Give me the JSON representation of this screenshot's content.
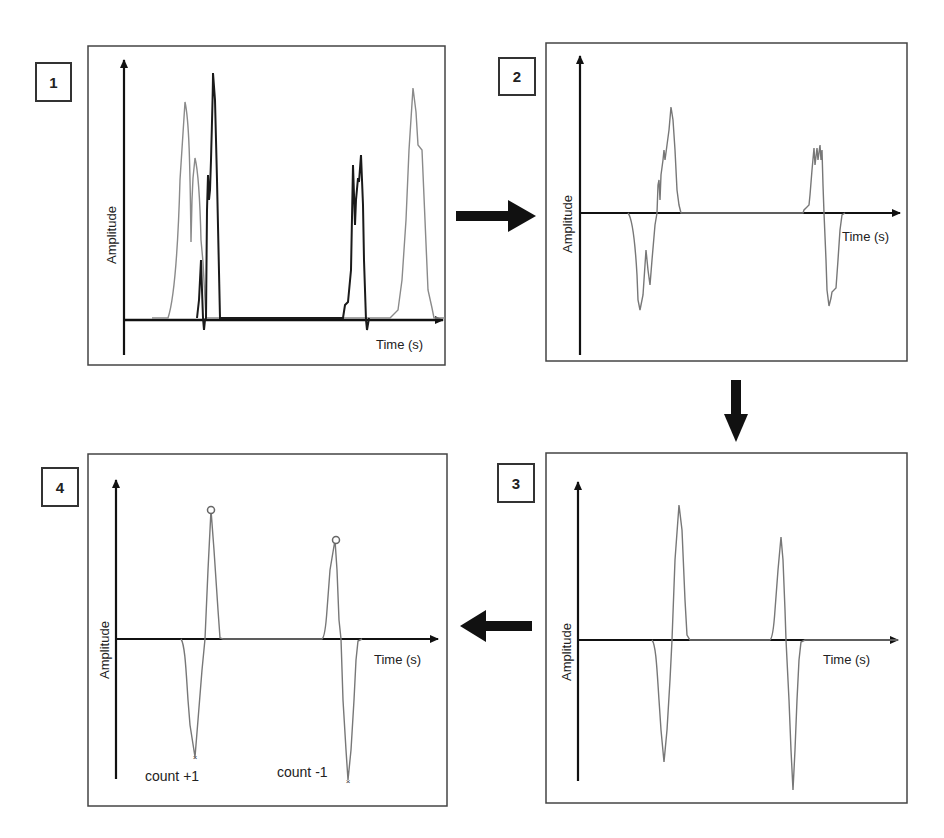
{
  "diagram": {
    "type": "process-flow",
    "flow": [
      "1",
      "2",
      "3",
      "4"
    ],
    "panels": [
      {
        "step": "1",
        "x_label": "Time (s)",
        "y_label": "Amplitude",
        "content": "Two overlapping raw signals (grey and black traces), each with two burst events above baseline"
      },
      {
        "step": "2",
        "x_label": "Time (s)",
        "y_label": "Amplitude",
        "content": "Difference signal with negative lobe followed by positive lobe (event 1) and positive lobe followed by negative lobe (event 2)"
      },
      {
        "step": "3",
        "x_label": "Time (s)",
        "y_label": "Amplitude",
        "content": "Smoothed bipolar pulses"
      },
      {
        "step": "4",
        "x_label": "Time (s)",
        "y_label": "Amplitude",
        "content": "Peaks marked (o) and troughs marked (x) with count annotations",
        "annotations": [
          "count +1",
          "count -1"
        ]
      }
    ],
    "arrows": [
      {
        "from": "1",
        "to": "2",
        "direction": "right"
      },
      {
        "from": "2",
        "to": "3",
        "direction": "down"
      },
      {
        "from": "3",
        "to": "4",
        "direction": "left"
      }
    ]
  },
  "colors": {
    "trace_grey": "#8a8a8a",
    "trace_black": "#1a1a1a",
    "axis": "#111111",
    "border": "#444444"
  }
}
